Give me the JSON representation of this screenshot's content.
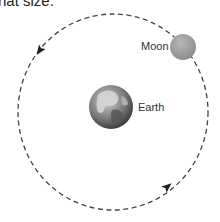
{
  "caption": "hat size.",
  "diagram": {
    "orbit": {
      "style": "dashed",
      "direction": "counterclockwise",
      "color": "#444444"
    },
    "bodies": [
      {
        "name": "Moon",
        "label": "Moon",
        "color": "#9a9a9a"
      },
      {
        "name": "Earth",
        "label": "Earth",
        "color": "#666666"
      }
    ],
    "arrows": [
      {
        "position": "upper-left",
        "direction": "down-left"
      },
      {
        "position": "lower-right",
        "direction": "up-right"
      }
    ]
  }
}
